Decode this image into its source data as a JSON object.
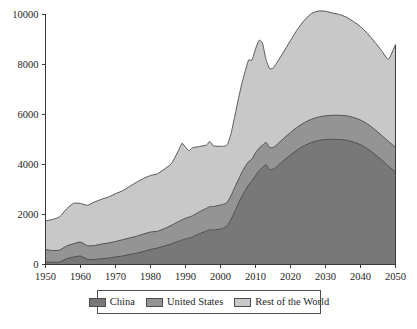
{
  "chart_data": {
    "type": "area",
    "stacked": true,
    "title": "",
    "subtitle": "",
    "xlabel": "",
    "ylabel": "",
    "xlim": [
      1950,
      2050
    ],
    "ylim": [
      0,
      10000
    ],
    "grid": false,
    "legend_position": "bottom",
    "xticks": [
      1950,
      1960,
      1970,
      1980,
      1990,
      2000,
      2010,
      2020,
      2030,
      2040,
      2050
    ],
    "xtick_labels": [
      "1950",
      "1960",
      "1970",
      "1980",
      "1990",
      "2000",
      "2010",
      "2020",
      "2030",
      "2040",
      "2050"
    ],
    "yticks": [
      0,
      2000,
      4000,
      6000,
      8000,
      10000
    ],
    "ytick_labels": [
      "0",
      "2000",
      "4000",
      "6000",
      "8000",
      "10000"
    ],
    "x": [
      1950,
      1952,
      1954,
      1956,
      1958,
      1960,
      1962,
      1964,
      1966,
      1968,
      1970,
      1972,
      1974,
      1976,
      1978,
      1980,
      1982,
      1984,
      1986,
      1988,
      1989,
      1990,
      1991,
      1992,
      1994,
      1996,
      1997,
      1998,
      2000,
      2001,
      2002,
      2003,
      2004,
      2005,
      2006,
      2007,
      2008,
      2009,
      2010,
      2011,
      2012,
      2013,
      2014,
      2015,
      2016,
      2018,
      2020,
      2022,
      2024,
      2026,
      2028,
      2030,
      2032,
      2034,
      2036,
      2038,
      2040,
      2042,
      2044,
      2046,
      2048,
      2050
    ],
    "series": [
      {
        "name": "China",
        "color": "#787878",
        "values": [
          100,
          90,
          95,
          230,
          300,
          340,
          210,
          200,
          230,
          260,
          300,
          340,
          400,
          450,
          520,
          600,
          660,
          740,
          830,
          930,
          980,
          1020,
          1060,
          1100,
          1230,
          1340,
          1390,
          1380,
          1420,
          1470,
          1560,
          1800,
          2100,
          2400,
          2700,
          2950,
          3180,
          3350,
          3560,
          3750,
          3880,
          3990,
          3800,
          3810,
          3900,
          4150,
          4380,
          4590,
          4760,
          4880,
          4960,
          5000,
          5010,
          5000,
          4970,
          4900,
          4790,
          4630,
          4420,
          4180,
          3930,
          3700
        ]
      },
      {
        "name": "United States",
        "color": "#949494",
        "values": [
          500,
          470,
          480,
          510,
          530,
          560,
          540,
          560,
          590,
          600,
          620,
          650,
          660,
          680,
          700,
          700,
          670,
          700,
          740,
          790,
          810,
          830,
          840,
          850,
          880,
          910,
          930,
          940,
          960,
          950,
          940,
          950,
          960,
          960,
          960,
          960,
          930,
          870,
          910,
          900,
          890,
          900,
          880,
          870,
          880,
          890,
          900,
          910,
          920,
          930,
          940,
          950,
          960,
          970,
          980,
          980,
          990,
          990,
          990,
          990,
          990,
          990
        ]
      },
      {
        "name": "Rest of the World",
        "color": "#c8c8c8",
        "values": [
          1150,
          1240,
          1330,
          1480,
          1620,
          1540,
          1620,
          1740,
          1790,
          1840,
          1910,
          1960,
          2060,
          2160,
          2220,
          2260,
          2300,
          2380,
          2470,
          2840,
          3060,
          2840,
          2650,
          2720,
          2610,
          2530,
          2600,
          2420,
          2350,
          2310,
          2300,
          2480,
          2820,
          3190,
          3520,
          3800,
          4060,
          3960,
          4150,
          4320,
          4080,
          3310,
          3160,
          3170,
          3270,
          3460,
          3680,
          3910,
          4100,
          4230,
          4240,
          4180,
          4090,
          4030,
          3940,
          3840,
          3740,
          3620,
          3500,
          3390,
          3290,
          4110
        ]
      }
    ],
    "totals_note": "Stacked totals peak near 10000 around 2034"
  },
  "legend": {
    "entries": [
      {
        "label": "China",
        "color": "#787878",
        "swatch": "legend-swatch-china"
      },
      {
        "label": "United States",
        "color": "#949494",
        "swatch": "legend-swatch-united-states"
      },
      {
        "label": "Rest of the World",
        "color": "#c8c8c8",
        "swatch": "legend-swatch-rest-of-the-world"
      }
    ]
  },
  "style": {
    "axis_color": "#3b3b3b",
    "outline_color": "#4a4a4a",
    "background": "#ffffff"
  }
}
